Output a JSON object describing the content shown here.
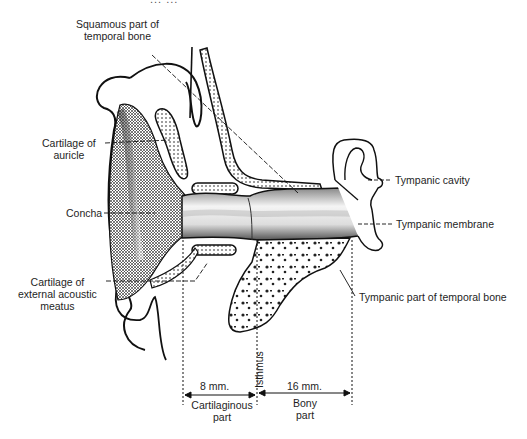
{
  "figure": {
    "title_fragment": "... ..."
  },
  "labels": {
    "squamous": [
      "Squamous part of",
      "temporal bone"
    ],
    "cartilage_auricle": [
      "Cartilage of",
      "auricle"
    ],
    "concha": "Concha",
    "cartilage_meatus": [
      "Cartilage of",
      "external acoustic",
      "meatus"
    ],
    "tympanic_cavity": "Tympanic cavity",
    "tympanic_membrane": "Tympanic membrane",
    "tympanic_part": "Tympanic part of temporal bone",
    "isthmus": "Isthmus"
  },
  "measurements": {
    "cartilaginous": {
      "length": "8 mm.",
      "label": [
        "Cartilaginous",
        "part"
      ]
    },
    "bony": {
      "length": "16 mm.",
      "label": [
        "Bony",
        "part"
      ]
    }
  },
  "colors": {
    "ink": "#1a1a1a",
    "background": "#ffffff"
  }
}
